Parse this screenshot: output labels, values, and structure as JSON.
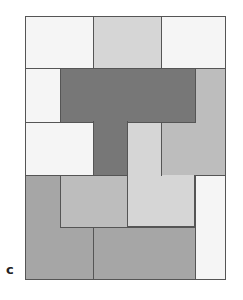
{
  "figure": {
    "panel_label": "c",
    "colors": {
      "white": "#f5f5f5",
      "light_gray": "#d6d6d6",
      "mid_light_gray": "#bdbdbd",
      "mid_gray": "#a6a6a6",
      "dark_gray": "#777777",
      "border": "#555555"
    },
    "blocks": [
      {
        "name": "top-left-white",
        "x": 25,
        "y": 16,
        "w": 68,
        "h": 52,
        "color": "white"
      },
      {
        "name": "top-middle-lightgray",
        "x": 93,
        "y": 16,
        "w": 68,
        "h": 52,
        "color": "light_gray"
      },
      {
        "name": "top-right-white",
        "x": 161,
        "y": 16,
        "w": 65,
        "h": 52,
        "color": "white"
      },
      {
        "name": "left-white-column",
        "x": 25,
        "y": 68,
        "w": 35,
        "h": 54,
        "color": "white"
      },
      {
        "name": "dark-t-bar",
        "x": 60,
        "y": 68,
        "w": 135,
        "h": 54,
        "color": "dark_gray"
      },
      {
        "name": "dark-t-stem",
        "x": 93,
        "y": 122,
        "w": 34,
        "h": 53,
        "color": "dark_gray"
      },
      {
        "name": "right-midgray-top",
        "x": 195,
        "y": 68,
        "w": 31,
        "h": 54,
        "color": "mid_light_gray"
      },
      {
        "name": "right-midgray-bottom",
        "x": 161,
        "y": 122,
        "w": 65,
        "h": 53,
        "color": "mid_light_gray"
      },
      {
        "name": "left-white-middle",
        "x": 25,
        "y": 122,
        "w": 68,
        "h": 53,
        "color": "white"
      },
      {
        "name": "center-lightgray-top",
        "x": 127,
        "y": 122,
        "w": 34,
        "h": 53,
        "color": "light_gray"
      },
      {
        "name": "center-lightgray-bottom",
        "x": 127,
        "y": 175,
        "w": 68,
        "h": 52,
        "color": "light_gray"
      },
      {
        "name": "inner-midgray",
        "x": 60,
        "y": 175,
        "w": 67,
        "h": 52,
        "color": "mid_light_gray"
      },
      {
        "name": "bottom-left-gray-l",
        "x": 25,
        "y": 175,
        "w": 35,
        "h": 105,
        "color": "mid_gray"
      },
      {
        "name": "bottom-left-gray-base",
        "x": 25,
        "y": 227,
        "w": 68,
        "h": 53,
        "color": "mid_gray"
      },
      {
        "name": "bottom-center-gray",
        "x": 93,
        "y": 227,
        "w": 102,
        "h": 53,
        "color": "mid_gray"
      },
      {
        "name": "right-white-strip",
        "x": 195,
        "y": 175,
        "w": 31,
        "h": 105,
        "color": "white"
      }
    ]
  }
}
